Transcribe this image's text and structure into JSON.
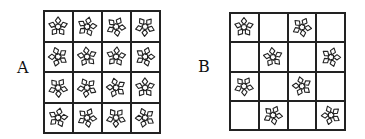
{
  "panels": [
    {
      "label": "A",
      "rows": 4,
      "cols": 4,
      "cells": [
        [
          1,
          1,
          1,
          1
        ],
        [
          1,
          1,
          1,
          1
        ],
        [
          1,
          1,
          1,
          1
        ],
        [
          1,
          1,
          1,
          1
        ]
      ]
    },
    {
      "label": "B",
      "rows": 4,
      "cols": 4,
      "cells": [
        [
          1,
          0,
          1,
          0
        ],
        [
          0,
          1,
          0,
          1
        ],
        [
          1,
          0,
          1,
          0
        ],
        [
          0,
          1,
          0,
          1
        ]
      ]
    }
  ],
  "icon": "flower-tile-icon",
  "colors": {
    "line": "#222222",
    "background": "#ffffff"
  }
}
